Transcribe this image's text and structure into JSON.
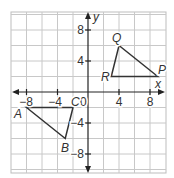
{
  "diagram": {
    "type": "coordinate-plane",
    "axes": {
      "x_label": "x",
      "y_label": "y",
      "origin_label": "0",
      "x_ticks": [
        {
          "value": -8,
          "label": "−8"
        },
        {
          "value": -4,
          "label": "−4"
        },
        {
          "value": 4,
          "label": "4"
        },
        {
          "value": 8,
          "label": "8"
        }
      ],
      "y_ticks": [
        {
          "value": 8,
          "label": "8"
        },
        {
          "value": 4,
          "label": "4"
        },
        {
          "value": -4,
          "label": "−4"
        },
        {
          "value": -8,
          "label": "−8"
        }
      ],
      "range": {
        "x": [
          -10,
          10
        ],
        "y": [
          -10,
          10
        ]
      },
      "grid_step": 2
    },
    "triangles": [
      {
        "name": "ABC",
        "vertices": [
          {
            "label": "A",
            "x": -8,
            "y": -2
          },
          {
            "label": "B",
            "x": -3,
            "y": -6
          },
          {
            "label": "C",
            "x": -2,
            "y": -2
          }
        ]
      },
      {
        "name": "PQR",
        "vertices": [
          {
            "label": "P",
            "x": 9,
            "y": 2
          },
          {
            "label": "Q",
            "x": 4,
            "y": 6
          },
          {
            "label": "R",
            "x": 3,
            "y": 2
          }
        ]
      }
    ],
    "colors": {
      "grid": "#c8c8c8",
      "axis": "#222222",
      "triangle": "#333333",
      "label": "#333333"
    }
  }
}
